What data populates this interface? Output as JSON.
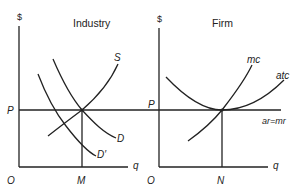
{
  "panels": {
    "industry": {
      "title": "Industry",
      "y_axis_label": "$",
      "x_axis_label": "q",
      "origin_label": "O",
      "price_label": "P",
      "quantity_label": "M",
      "curves": {
        "supply": "S",
        "demand": "D",
        "demand_shifted": "D′"
      }
    },
    "firm": {
      "title": "Firm",
      "y_axis_label": "$",
      "x_axis_label": "q",
      "origin_label": "O",
      "price_label": "P",
      "quantity_label": "N",
      "curves": {
        "marginal_cost": "mc",
        "average_total_cost": "atc",
        "revenue_line": "ar=mr"
      }
    }
  }
}
